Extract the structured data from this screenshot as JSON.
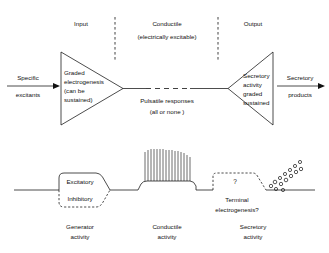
{
  "figure": {
    "upper_diagram": {
      "zone_headers": [
        {
          "id": "input",
          "label": "Input"
        },
        {
          "id": "conductile",
          "label": "Conductile",
          "sublabel": "(electrically excitable)"
        },
        {
          "id": "output",
          "label": "Output"
        }
      ],
      "input_arrow": {
        "top_label": "Specific",
        "bottom_label": "excitants"
      },
      "output_arrow": {
        "top_label": "Secretory",
        "bottom_label": "products"
      },
      "input_triangle_text": [
        "Graded",
        "electrogenesis",
        "(can be",
        "sustained)"
      ],
      "middle_text": [
        "Pulsatile  responses",
        "(all or none )"
      ],
      "output_triangle_text": [
        "Secretory",
        "activity",
        "graded",
        "sustained"
      ]
    },
    "lower_diagram": {
      "generator": {
        "excitatory_label": "Excitatory",
        "inhibitory_label": "Inhibitory",
        "caption_line1": "Generator",
        "caption_line2": "activity"
      },
      "conductile": {
        "caption_line1": "Conductile",
        "caption_line2": "activity",
        "spike_count": 16
      },
      "secretory": {
        "question_mark": "?",
        "terminal_line1": "Terminal",
        "terminal_line2": "electrogenesis?",
        "caption_line1": "Secretory",
        "caption_line2": "activity",
        "vesicle_count": 14
      }
    },
    "colors": {
      "ink": "#111111",
      "background": "#ffffff"
    }
  }
}
